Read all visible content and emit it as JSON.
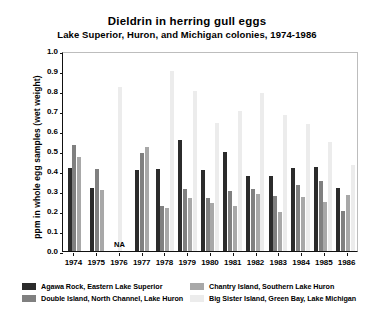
{
  "chart_data": {
    "type": "bar",
    "title": "Dieldrin in herring gull eggs",
    "subtitle": "Lake Superior, Huron, and Michigan colonies, 1974-1986",
    "xlabel": "",
    "ylabel": "ppm in whole egg samples (wet weight)",
    "ylim": [
      0.0,
      1.0
    ],
    "ytick_step": 0.1,
    "grid": false,
    "legend_position": "below-axes",
    "categories": [
      "1974",
      "1975",
      "1976",
      "1977",
      "1978",
      "1979",
      "1980",
      "1981",
      "1982",
      "1983",
      "1984",
      "1985",
      "1986"
    ],
    "yticks": [
      "1.0",
      "0.9",
      "0.8",
      "0.7",
      "0.6",
      "0.5",
      "0.4",
      "0.3",
      "0.2",
      "0.1",
      "0.0"
    ],
    "annotations": [
      {
        "category": "1976",
        "text": "NA"
      }
    ],
    "colors": {
      "agawa_rock": "#2b2b2b",
      "double_island": "#808080",
      "chantry_island": "#a8a8a8",
      "big_sister_island": "#ececec"
    },
    "series": [
      {
        "name": "Agawa Rock, Eastern Lake Superior",
        "color": "#2b2b2b",
        "values": [
          0.415,
          0.315,
          null,
          0.405,
          0.41,
          0.555,
          0.405,
          0.495,
          0.375,
          0.375,
          0.415,
          0.42,
          0.315
        ]
      },
      {
        "name": "Double Island, North Channel, Lake Huron",
        "color": "#808080",
        "values": [
          0.53,
          0.41,
          null,
          0.49,
          0.225,
          0.31,
          0.265,
          0.3,
          0.31,
          0.275,
          0.33,
          0.35,
          0.2
        ]
      },
      {
        "name": "Chantry Island, Southern Lake Huron",
        "color": "#a8a8a8",
        "values": [
          0.47,
          0.305,
          null,
          0.52,
          0.215,
          0.265,
          0.24,
          0.225,
          0.285,
          0.195,
          0.27,
          0.245,
          0.28
        ]
      },
      {
        "name": "Big Sister Island, Green Bay, Lake Michigan",
        "color": "#ececec",
        "values": [
          null,
          null,
          0.82,
          null,
          0.9,
          0.8,
          0.64,
          0.7,
          0.79,
          0.68,
          0.635,
          0.545,
          0.43
        ]
      }
    ]
  },
  "legend": {
    "entries": [
      {
        "label": "Agawa Rock, Eastern Lake Superior",
        "color": "#2b2b2b"
      },
      {
        "label": "Chantry Island, Southern Lake Huron",
        "color": "#a8a8a8"
      },
      {
        "label": "Double Island, North Channel, Lake Huron",
        "color": "#808080"
      },
      {
        "label": "Big Sister Island, Green Bay, Lake Michigan",
        "color": "#ececec"
      }
    ]
  }
}
